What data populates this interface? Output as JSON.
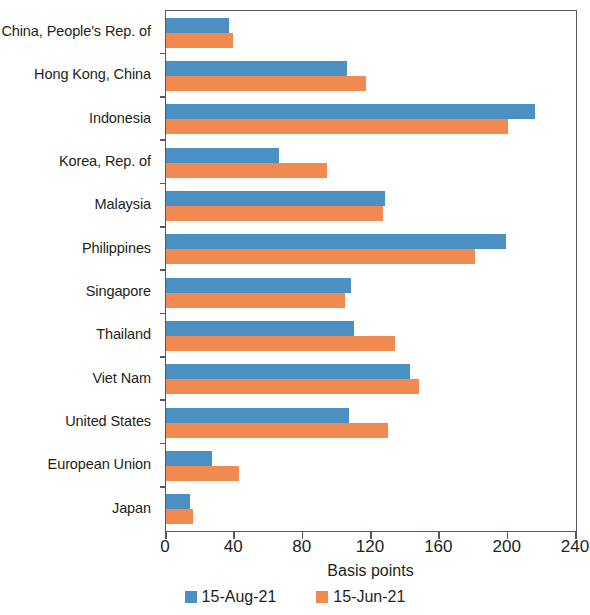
{
  "chart_data": {
    "type": "bar",
    "orientation": "horizontal",
    "title": "",
    "xlabel": "Basis points",
    "ylabel": "",
    "xlim": [
      0,
      240
    ],
    "xticks": [
      0,
      40,
      80,
      120,
      160,
      200,
      240
    ],
    "xtick_labels": [
      "0",
      "40",
      "80",
      "120",
      "160",
      "200",
      "240"
    ],
    "grid": false,
    "legend_position": "bottom-center",
    "categories": [
      "China, People's Rep. of",
      "Hong Kong, China",
      "Indonesia",
      "Korea, Rep. of",
      "Malaysia",
      "Philippines",
      "Singapore",
      "Thailand",
      "Viet Nam",
      "United States",
      "European Union",
      "Japan"
    ],
    "series": [
      {
        "name": "15-Aug-21",
        "color": "#4a90c2",
        "values": [
          37,
          106,
          216,
          66,
          128,
          199,
          108,
          110,
          143,
          107,
          27,
          14
        ]
      },
      {
        "name": "15-Jun-21",
        "color": "#f18a50",
        "values": [
          39,
          117,
          200,
          94,
          127,
          181,
          105,
          134,
          148,
          130,
          43,
          16
        ]
      }
    ]
  },
  "axis": {
    "x_title": "Basis points"
  },
  "legend": {
    "entries": [
      {
        "label": "15-Aug-21",
        "color": "#4a90c2"
      },
      {
        "label": "15-Jun-21",
        "color": "#f18a50"
      }
    ]
  },
  "colors": {
    "series_blue": "#4a90c2",
    "series_orange": "#f18a50",
    "axis": "#58585b",
    "text": "#231f20",
    "background": "#ffffff"
  }
}
